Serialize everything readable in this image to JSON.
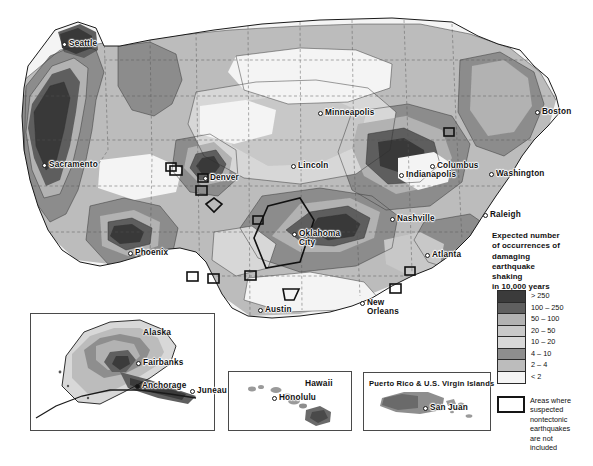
{
  "figure": {
    "type": "choropleth-hazard-map",
    "region": "United States"
  },
  "legend": {
    "title": "Expected number\nof occurrences of\ndamaging\nearthquake\nshaking\nin 10,000 years",
    "classes": [
      {
        "label": "> 250",
        "color": "#3b3b3b"
      },
      {
        "label": "100 – 250",
        "color": "#5f5f5f"
      },
      {
        "label": "50 – 100",
        "color": "#b2b2b2"
      },
      {
        "label": "20 – 50",
        "color": "#c9c9c9"
      },
      {
        "label": "10 – 20",
        "color": "#d8d8d8"
      },
      {
        "label": "4 – 10",
        "color": "#8e8e8e"
      },
      {
        "label": "2 – 4",
        "color": "#bcbcbc"
      },
      {
        "label": "< 2",
        "color": "#f4f4f4"
      }
    ],
    "note": {
      "swatch": "outlined-rectangle",
      "text": "Areas where\nsuspected\nnontectonic\nearthquakes\nare not\nincluded"
    }
  },
  "main_map": {
    "cities": [
      {
        "name": "Seattle",
        "x": 62,
        "y": 40,
        "side": "right",
        "dot": "hollow"
      },
      {
        "name": "Sacramento",
        "x": 42,
        "y": 161,
        "side": "right",
        "dot": "hollow"
      },
      {
        "name": "Phoenix",
        "x": 128,
        "y": 249,
        "side": "right",
        "dot": "hollow"
      },
      {
        "name": "Denver",
        "x": 203,
        "y": 174,
        "side": "right",
        "dot": "hollow"
      },
      {
        "name": "Lincoln",
        "x": 291,
        "y": 162,
        "side": "right",
        "dot": "hollow"
      },
      {
        "name": "Minneapolis",
        "x": 318,
        "y": 109,
        "side": "right",
        "dot": "hollow"
      },
      {
        "name": "Oklahoma\nCity",
        "x": 292,
        "y": 230,
        "side": "right",
        "dot": "hollow"
      },
      {
        "name": "Austin",
        "x": 258,
        "y": 306,
        "side": "right",
        "dot": "hollow"
      },
      {
        "name": "New\nOrleans",
        "x": 360,
        "y": 299,
        "side": "right",
        "dot": "hollow"
      },
      {
        "name": "Atlanta",
        "x": 425,
        "y": 251,
        "side": "right",
        "dot": "hollow"
      },
      {
        "name": "Nashville",
        "x": 390,
        "y": 215,
        "side": "right",
        "dot": "hollow"
      },
      {
        "name": "Indianapolis",
        "x": 399,
        "y": 171,
        "side": "right",
        "dot": "hollow"
      },
      {
        "name": "Columbus",
        "x": 430,
        "y": 162,
        "side": "right",
        "dot": "hollow"
      },
      {
        "name": "Raleigh",
        "x": 483,
        "y": 211,
        "side": "right",
        "dot": "hollow"
      },
      {
        "name": "Washington",
        "x": 489,
        "y": 170,
        "side": "right",
        "dot": "hollow"
      },
      {
        "name": "Boston",
        "x": 535,
        "y": 108,
        "side": "right",
        "dot": "hollow"
      }
    ]
  },
  "insets": [
    {
      "id": "alaska",
      "title": "Alaska",
      "title_x": 143,
      "title_y": 327,
      "frame": {
        "x": 30,
        "y": 313,
        "w": 185,
        "h": 118
      },
      "cities": [
        {
          "name": "Fairbanks",
          "x": 136,
          "y": 359,
          "dot": "hollow"
        },
        {
          "name": "Anchorage",
          "x": 135,
          "y": 382,
          "dot": "filled"
        },
        {
          "name": "Juneau",
          "x": 190,
          "y": 387,
          "dot": "hollow"
        }
      ]
    },
    {
      "id": "hawaii",
      "title": "Hawaii",
      "title_x": 305,
      "title_y": 378,
      "frame": {
        "x": 228,
        "y": 371,
        "w": 124,
        "h": 60
      },
      "cities": [
        {
          "name": "Honolulu",
          "x": 272,
          "y": 394,
          "dot": "hollow"
        }
      ]
    },
    {
      "id": "puerto-rico",
      "title": "Puerto Rico & U.S. Virgin Islands",
      "title_x": 369,
      "title_y": 379,
      "frame": {
        "x": 363,
        "y": 372,
        "w": 128,
        "h": 59
      },
      "cities": [
        {
          "name": "San Juan",
          "x": 423,
          "y": 404,
          "dot": "hollow"
        }
      ]
    }
  ]
}
